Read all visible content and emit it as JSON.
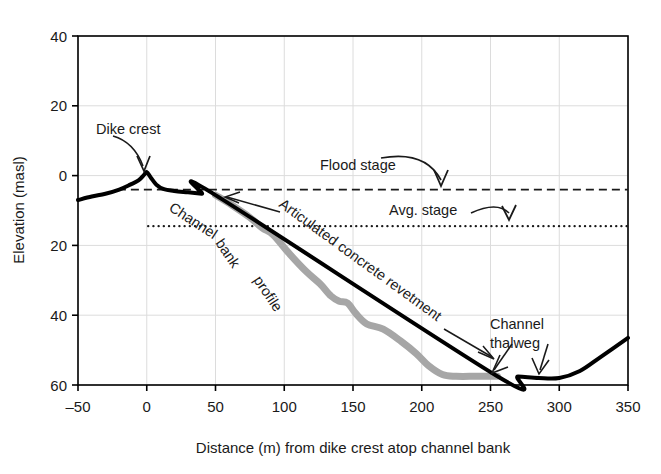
{
  "chart_data": {
    "type": "line",
    "title": "",
    "xlabel": "Distance (m) from dike crest atop channel bank",
    "ylabel": "Elevation (masl)",
    "xlim": [
      -50,
      350
    ],
    "ylim": [
      -60,
      40
    ],
    "y_axis_note": "Tick labels printed without minus sign below zero; axis descends 40, 20, 0, 20, 40, 60",
    "xticks": [
      "-50",
      "0",
      "50",
      "100",
      "150",
      "200",
      "250",
      "300",
      "350"
    ],
    "xtick_values": [
      -50,
      0,
      50,
      100,
      150,
      200,
      250,
      300,
      350
    ],
    "yticks": [
      "40",
      "20",
      "0",
      "20",
      "40",
      "60"
    ],
    "ytick_values": [
      40,
      20,
      0,
      -20,
      -40,
      -60
    ],
    "grid": true,
    "legend": "none",
    "series": [
      {
        "name": "Dike and channel bed profile (black)",
        "color": "#000000",
        "style": "solid",
        "width": 4,
        "x": [
          -50,
          -40,
          -30,
          -20,
          -12,
          -6,
          -2,
          0,
          3,
          7,
          12,
          20,
          30,
          40,
          50,
          255,
          270,
          285,
          300,
          315,
          330,
          350
        ],
        "y": [
          -7.0,
          -6.0,
          -5.2,
          -4.0,
          -2.6,
          -1.4,
          0.2,
          1.0,
          -0.6,
          -2.6,
          -3.8,
          -4.4,
          -4.8,
          -5.2,
          -5.6,
          -57.5,
          -57.6,
          -58.0,
          -58.0,
          -56.0,
          -52.0,
          -46.5
        ]
      },
      {
        "name": "Articulated concrete revetment (gray)",
        "color": "#a6a6a6",
        "style": "solid",
        "width": 7,
        "x": [
          50,
          62,
          75,
          84,
          92,
          104,
          116,
          126,
          134,
          140,
          146,
          152,
          160,
          172,
          185,
          196,
          205,
          215,
          225,
          240,
          255
        ],
        "y": [
          -5.6,
          -8.5,
          -12.0,
          -15.0,
          -17.0,
          -22.5,
          -27.5,
          -31.0,
          -34.5,
          -36.0,
          -36.5,
          -39.5,
          -42.5,
          -44.0,
          -47.5,
          -51.0,
          -54.5,
          -57.0,
          -57.5,
          -57.5,
          -57.5
        ]
      }
    ],
    "reference_lines": [
      {
        "name": "Flood stage",
        "value": -4.0,
        "style": "dashed",
        "color": "#1a1a1a",
        "x_start": -21,
        "x_end": 350
      },
      {
        "name": "Avg. stage",
        "value": -14.5,
        "style": "dotted",
        "color": "#1a1a1a",
        "x_start": 1,
        "x_end": 350
      }
    ],
    "annotations": [
      {
        "text": "Dike crest",
        "x": -35,
        "y": 10,
        "arrow_to_x": 0,
        "arrow_to_y": 2
      },
      {
        "text": "Flood stage",
        "x": 130,
        "y": 8,
        "arrow_to_x": 190,
        "arrow_to_y": -2
      },
      {
        "text": "Avg. stage",
        "x": 193,
        "y": -10,
        "arrow_to_x": 240,
        "arrow_to_y": -13
      },
      {
        "text": "Channel bank profile",
        "x": 40,
        "y": -20,
        "rotated": true
      },
      {
        "text": "Articulated concrete revetment",
        "x": 105,
        "y": -22,
        "rotated": true,
        "arrow_to_x": 52,
        "arrow_to_y": -7
      },
      {
        "text": "Channel thalweg",
        "x": 268,
        "y": -44,
        "arrow_to_x": 256,
        "arrow_to_y": -57
      }
    ]
  },
  "labels": {
    "dike_crest": "Dike crest",
    "flood_stage": "Flood stage",
    "avg_stage": "Avg. stage",
    "channel_bank_profile_1": "Channel",
    "channel_bank_profile_2": "bank",
    "channel_bank_profile_3": "profile",
    "revetment": "Articulated concrete revetment",
    "thalweg_1": "Channel",
    "thalweg_2": "thalweg"
  },
  "colors": {
    "profile_black": "#000000",
    "revetment_gray": "#a6a6a6",
    "grid": "#dcdcdc",
    "axis": "#000000"
  }
}
